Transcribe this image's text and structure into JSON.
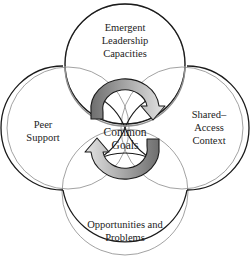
{
  "diagram": {
    "circles": [
      {
        "id": "top",
        "label_lines": [
          "Emergent",
          "Leadership",
          "Capacities"
        ]
      },
      {
        "id": "left",
        "label_lines": [
          "Peer",
          "Support"
        ]
      },
      {
        "id": "right",
        "label_lines": [
          "Shared–",
          "Access",
          "Context"
        ]
      },
      {
        "id": "bottom",
        "label_lines": [
          "Opportunities and",
          "Problems"
        ]
      }
    ],
    "center": {
      "label_lines": [
        "Common",
        "Goals"
      ]
    },
    "arrows": [
      {
        "id": "top-arrow",
        "direction": "clockwise",
        "from": "left",
        "to": "right"
      },
      {
        "id": "bottom-arrow",
        "direction": "clockwise",
        "from": "right",
        "to": "left"
      }
    ],
    "colors": {
      "outline": "#1a1a1a",
      "inner_line": "#8a8a8a",
      "arrow_dark": "#6e6e6e",
      "arrow_light": "#e2e2e2"
    }
  }
}
